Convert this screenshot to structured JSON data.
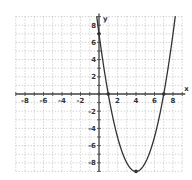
{
  "chart_data": {
    "type": "line",
    "title": "",
    "xlabel": "x",
    "ylabel": "y",
    "xlim": [
      -9,
      9
    ],
    "ylim": [
      -9,
      9
    ],
    "grid": true,
    "x_ticks": [
      -8,
      -6,
      -4,
      -2,
      2,
      4,
      6,
      8
    ],
    "y_ticks": [
      8,
      6,
      4,
      2,
      -2,
      -4,
      -6,
      -8
    ],
    "series": [
      {
        "name": "parabola",
        "equation": "y = x^2 - 8x + 7",
        "x": [
          -0.2,
          0,
          1,
          2,
          3,
          4,
          5,
          6,
          7,
          8,
          8.2
        ],
        "y": [
          8.64,
          7,
          0,
          -5,
          -8,
          -9,
          -8,
          -5,
          0,
          7,
          8.64
        ]
      }
    ],
    "annotations": [
      {
        "label": "y-intercept",
        "x": 0,
        "y": 7
      },
      {
        "label": "x-intercept",
        "x": 1,
        "y": 0
      },
      {
        "label": "x-intercept",
        "x": 7,
        "y": 0
      },
      {
        "label": "vertex",
        "x": 4,
        "y": -9
      }
    ]
  },
  "axes": {
    "x_label": "x",
    "y_label": "y",
    "x_tick_labels": [
      "-8",
      "-6",
      "-4",
      "-2",
      "2",
      "4",
      "6",
      "8"
    ],
    "y_tick_labels": [
      "8",
      "6",
      "4",
      "2",
      "-2",
      "-4",
      "-6",
      "-8"
    ]
  },
  "colors": {
    "curve": "#333333",
    "axis": "#444444",
    "grid": "#9a9a9a"
  }
}
